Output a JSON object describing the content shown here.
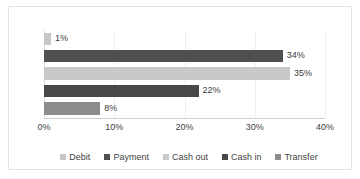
{
  "chart_data": {
    "type": "bar",
    "orientation": "horizontal",
    "title": "",
    "subtitle": "",
    "xlabel": "",
    "ylabel": "",
    "categories": [
      "Debit",
      "Payment",
      "Cash out",
      "Cash in",
      "Transfer"
    ],
    "values": [
      1,
      34,
      35,
      22,
      8
    ],
    "data_labels": [
      "1%",
      "34%",
      "35%",
      "22%",
      "8%"
    ],
    "series": [
      {
        "name": "Percentage of transactions",
        "values": [
          1,
          34,
          35,
          22,
          8
        ]
      }
    ],
    "xlim": [
      0,
      40
    ],
    "xticks": [
      0,
      10,
      20,
      30,
      40
    ],
    "xtick_labels": [
      "0%",
      "10%",
      "20%",
      "30%",
      "40%"
    ],
    "grid": true,
    "grid_axis": "x",
    "legend_position": "bottom",
    "legend_entries": [
      {
        "label": "Debit",
        "color": "#c6c6c6"
      },
      {
        "label": "Payment",
        "color": "#4f4f4f"
      },
      {
        "label": "Cash out",
        "color": "#c9c9c9"
      },
      {
        "label": "Cash in",
        "color": "#484848"
      },
      {
        "label": "Transfer",
        "color": "#8c8c8c"
      }
    ],
    "bar_colors": [
      "#c6c6c6",
      "#4f4f4f",
      "#c9c9c9",
      "#484848",
      "#8c8c8c"
    ]
  },
  "axis": {
    "tick_0": "0%",
    "tick_1": "10%",
    "tick_2": "20%",
    "tick_3": "30%",
    "tick_4": "40%"
  },
  "labels": {
    "debit": "1%",
    "payment": "34%",
    "cash_out": "35%",
    "cash_in": "22%",
    "transfer": "8%"
  },
  "legend": {
    "debit": "Debit",
    "payment": "Payment",
    "cash_out": "Cash out",
    "cash_in": "Cash in",
    "transfer": "Transfer"
  }
}
